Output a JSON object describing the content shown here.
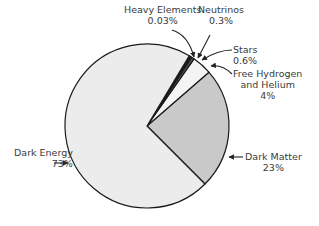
{
  "chart_data": {
    "type": "pie",
    "title": "",
    "slices": [
      {
        "label": "Dark Energy",
        "value": 73,
        "display": "73%",
        "color": "#ececec"
      },
      {
        "label": "Dark Matter",
        "value": 23,
        "display": "23%",
        "color": "#c9c9c9"
      },
      {
        "label": "Free Hydrogen and Helium",
        "value": 4,
        "display": "4%",
        "color": "#f4f4f4"
      },
      {
        "label": "Stars",
        "value": 0.6,
        "display": "0.6%",
        "color": "#555555"
      },
      {
        "label": "Neutrinos",
        "value": 0.3,
        "display": "0.3%",
        "color": "#222222"
      },
      {
        "label": "Heavy Elements",
        "value": 0.03,
        "display": "0.03%",
        "color": "#000000"
      }
    ],
    "legend": "none (callout labels with arrows)"
  },
  "labels": {
    "heavy_elements": {
      "name": "Heavy Elements",
      "pct": "0.03%"
    },
    "neutrinos": {
      "name": "Neutrinos",
      "pct": "0.3%"
    },
    "stars": {
      "name": "Stars",
      "pct": "0.6%"
    },
    "free_hydrogen": {
      "name1": "Free Hydrogen",
      "name2": "and Helium",
      "pct": "4%"
    },
    "dark_matter": {
      "name": "Dark Matter",
      "pct": "23%"
    },
    "dark_energy": {
      "name": "Dark Energy",
      "pct": "73%"
    }
  }
}
